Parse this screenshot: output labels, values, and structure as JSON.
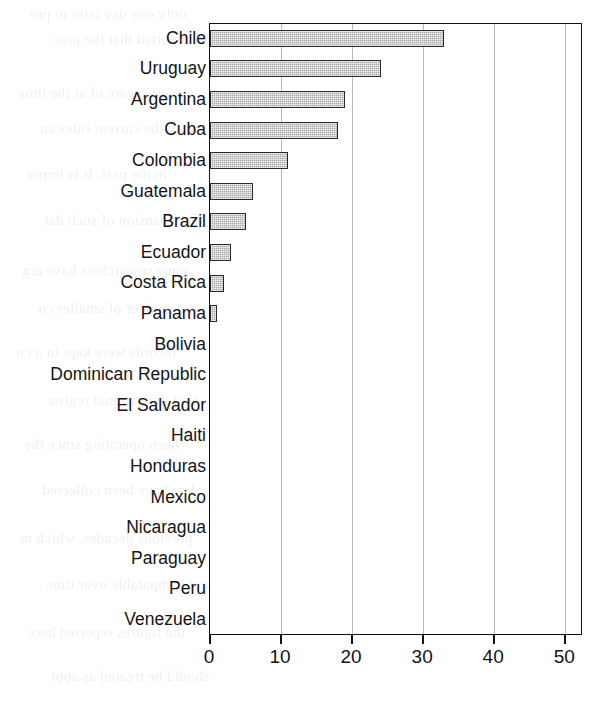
{
  "chart_data": {
    "type": "bar",
    "orientation": "horizontal",
    "title": "",
    "subtitle": "",
    "xlabel": "",
    "ylabel": "",
    "xlim": [
      0,
      52.5
    ],
    "ylim": null,
    "grid": "vertical",
    "legend": "none",
    "xticks": [
      0,
      10,
      20,
      30,
      40,
      50
    ],
    "xtick_labels": [
      "0",
      "10",
      "20",
      "30",
      "40",
      "50"
    ],
    "bar_fill_color": "#aaaaaa",
    "bar_edge_color": "#2b2b2b",
    "grid_color": "#b9b9b9",
    "axis_color": "#111111",
    "background_color": "#ffffff",
    "categories": [
      "Chile",
      "Uruguay",
      "Argentina",
      "Cuba",
      "Colombia",
      "Guatemala",
      "Brazil",
      "Ecuador",
      "Costa Rica",
      "Panama",
      "Bolivia",
      "Dominican Republic",
      "El Salvador",
      "Haiti",
      "Honduras",
      "Mexico",
      "Nicaragua",
      "Paraguay",
      "Peru",
      "Venezuela"
    ],
    "values": [
      33,
      24,
      19,
      18,
      11,
      6,
      5,
      3,
      2,
      1,
      0,
      0,
      0,
      0,
      0,
      0,
      0,
      0,
      0,
      0
    ]
  },
  "ghost_text": {
    "lines": [
      "only one day later to pre",
      "he reported that the proc",
      "were aware of at the time",
      "with the current rules an",
      "in the past. It is impor",
      "the expansion of such dat",
      "some researchers have arg",
      "in a number of smaller co",
      "records were kept in a co",
      "that the national registr",
      "been operating since the",
      "data have been collected",
      "previous decades, which m",
      "and comparable over time",
      "the figures reported here",
      "should be treated as appr"
    ]
  }
}
